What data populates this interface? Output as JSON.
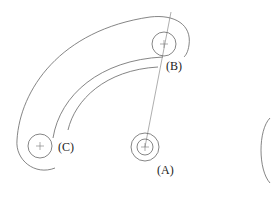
{
  "diagram": {
    "type": "mechanism-slot-drawing",
    "points": [
      {
        "id": "A",
        "label": "(A)",
        "cx": 145,
        "cy": 147
      },
      {
        "id": "B",
        "label": "(B)",
        "cx": 164,
        "cy": 44
      },
      {
        "id": "C",
        "label": "(C)",
        "cx": 40,
        "cy": 146
      }
    ],
    "labels": {
      "a": "(A)",
      "b": "(B)",
      "c": "(C)"
    },
    "colors": {
      "line": "#666666",
      "text": "#222222",
      "background": "#ffffff"
    }
  }
}
